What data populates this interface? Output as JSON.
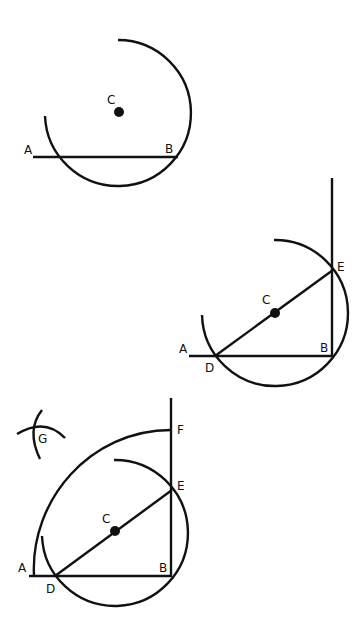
{
  "colors": {
    "ink": "#111111",
    "background": "#ffffff"
  },
  "figures": [
    {
      "step": 1,
      "labels": {
        "a": "A",
        "b": "B",
        "c": "C"
      },
      "description": "Arc drawn about center C passing through end point B of line AB"
    },
    {
      "step": 2,
      "labels": {
        "a": "A",
        "b": "B",
        "c": "C",
        "d": "D",
        "e": "E"
      },
      "description": "Line from D through C meets arc at E; BE is the perpendicular"
    },
    {
      "step": 3,
      "labels": {
        "a": "A",
        "b": "B",
        "c": "C",
        "d": "D",
        "e": "E",
        "f": "F",
        "g": "G"
      },
      "description": "Arc from F to A with intersecting arcs at G"
    }
  ]
}
